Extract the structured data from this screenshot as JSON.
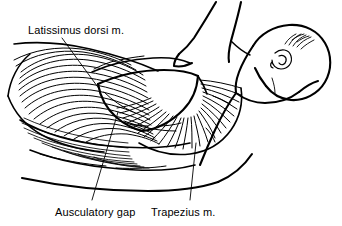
{
  "figure": {
    "background_color": "#ffffff",
    "ink_color": "#000000",
    "width": 342,
    "height": 226,
    "style": "black-and-white pen-and-ink medical illustration"
  },
  "labels": {
    "latissimus": "Latissimus dorsi m.",
    "ausculatory": "Ausculatory gap",
    "trapezius": "Trapezius m."
  },
  "annotations": [
    {
      "name": "latissimus-dorsi-label",
      "text": "Latissimus dorsi m.",
      "position": "top-left",
      "leader": "descends from label down-right into the latissimus dorsi muscle fiber field"
    },
    {
      "name": "ausculatory-gap-label",
      "text": "Ausculatory gap",
      "position": "bottom-left",
      "leader": "rises from label up-right to the blank triangular auscultatory gap"
    },
    {
      "name": "trapezius-label",
      "text": "Trapezius m.",
      "position": "bottom-center-right",
      "leader": "rises from label up-right into the fanned trapezius fibers"
    }
  ],
  "anatomy": {
    "parts": [
      "head with ear and hair strokes",
      "neck",
      "raised arm extending off the top edge",
      "shoulder and scapular region",
      "latissimus dorsi muscle with curved parallel fibers",
      "trapezius muscle with radiating fan-shaped fibers",
      "auscultatory gap (blank triangular region)",
      "lower torso contour"
    ]
  }
}
